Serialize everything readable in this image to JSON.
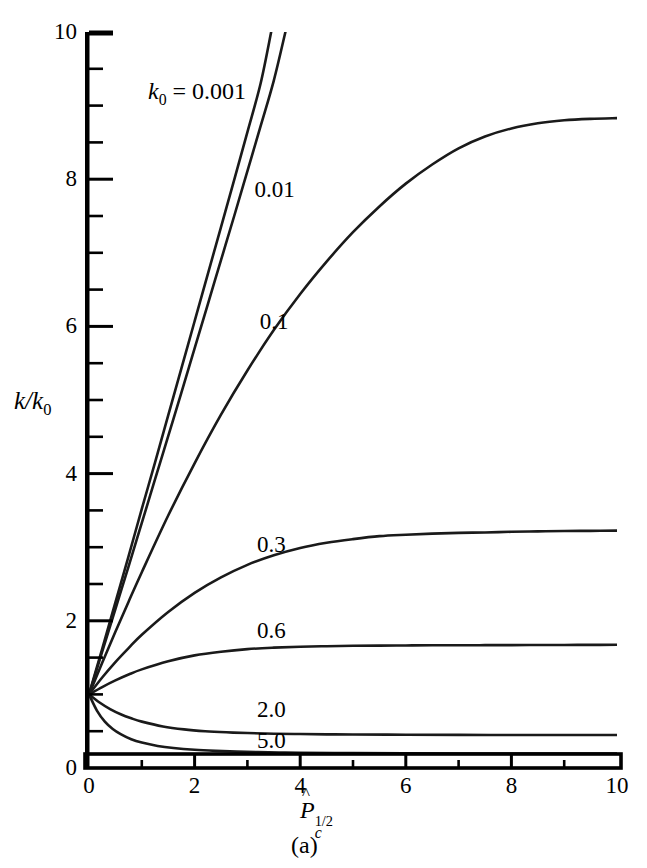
{
  "figure": {
    "caption": "(a)",
    "annotation_k0_prefix": "k",
    "annotation_k0_sub": "0",
    "annotation_k0_eq": " = 0.001",
    "axis_title_y_num": "k",
    "axis_title_y_den": "k",
    "axis_title_y_den_sub": "0",
    "axis_title_y_slash": "/",
    "axis_title_x_main": "P",
    "axis_title_x_sub": "c",
    "axis_title_x_sup": "1/2",
    "line_color": "#1a1a1a",
    "axis_color": "#000000",
    "background": "#ffffff"
  },
  "chart_data": {
    "type": "line",
    "title": "",
    "subtitle": "(a)",
    "xlabel": "P̂c^(1/2)",
    "ylabel": "k/k0",
    "xlim": [
      0,
      10
    ],
    "ylim": [
      0,
      10
    ],
    "grid": false,
    "legend_position": "inline-curve-labels",
    "x_ticks_major": [
      0,
      2,
      4,
      6,
      8,
      10
    ],
    "x_ticks_minor": [
      1,
      3,
      5,
      7,
      9
    ],
    "y_ticks_major": [
      0,
      2,
      4,
      6,
      8,
      10
    ],
    "y_ticks_minor": [
      0.5,
      1,
      1.5,
      2.5,
      3,
      3.5,
      4.5,
      5,
      5.5,
      6.5,
      7,
      7.5,
      8.5,
      9,
      9.5
    ],
    "x_tick_labels": [
      "0",
      "2",
      "4",
      "6",
      "8",
      "10"
    ],
    "y_tick_labels": [
      "0",
      "2",
      "4",
      "6",
      "8",
      "10"
    ],
    "annotation": "k0 = 0.001",
    "series": [
      {
        "name": "0.001",
        "label": "0.001",
        "label_x": 2.55,
        "label_y": 9.1,
        "label_anchor": "annotation",
        "x": [
          0,
          0.25,
          0.5,
          0.75,
          1.0,
          1.25,
          1.5,
          1.75,
          2.0,
          2.25,
          2.5,
          2.75,
          3.0,
          3.25,
          3.45
        ],
        "y": [
          1.0,
          1.62,
          2.25,
          2.88,
          3.52,
          4.15,
          4.79,
          5.43,
          6.07,
          6.71,
          7.35,
          7.99,
          8.64,
          9.3,
          10.0
        ]
      },
      {
        "name": "0.01",
        "label": "0.01",
        "label_x": 3.55,
        "label_y": 7.85,
        "x": [
          0,
          0.25,
          0.5,
          0.75,
          1.0,
          1.25,
          1.5,
          1.75,
          2.0,
          2.25,
          2.5,
          2.75,
          3.0,
          3.25,
          3.5,
          3.72
        ],
        "y": [
          1.0,
          1.58,
          2.16,
          2.74,
          3.33,
          3.92,
          4.51,
          5.1,
          5.7,
          6.3,
          6.9,
          7.5,
          8.11,
          8.72,
          9.34,
          10.0
        ]
      },
      {
        "name": "0.1",
        "label": "0.1",
        "label_x": 3.65,
        "label_y": 6.06,
        "x": [
          0,
          0.25,
          0.5,
          0.75,
          1.0,
          1.5,
          2.0,
          2.5,
          3.0,
          3.5,
          4.0,
          4.5,
          5.0,
          5.5,
          6.0,
          6.5,
          7.0,
          7.5,
          8.0,
          8.5,
          9.0,
          9.5,
          10.0
        ],
        "y": [
          1.0,
          1.43,
          1.85,
          2.26,
          2.66,
          3.43,
          4.14,
          4.8,
          5.4,
          5.95,
          6.44,
          6.88,
          7.28,
          7.63,
          7.94,
          8.2,
          8.42,
          8.58,
          8.69,
          8.76,
          8.8,
          8.82,
          8.83
        ]
      },
      {
        "name": "0.3",
        "label": "0.3",
        "label_x": 3.6,
        "label_y": 3.03,
        "x": [
          0,
          0.25,
          0.5,
          0.75,
          1.0,
          1.5,
          2.0,
          2.5,
          3.0,
          3.5,
          4.0,
          4.5,
          5.0,
          5.5,
          6.0,
          6.5,
          7.0,
          7.5,
          8.0,
          8.5,
          9.0,
          9.5,
          10.0
        ],
        "y": [
          1.0,
          1.23,
          1.44,
          1.63,
          1.81,
          2.12,
          2.38,
          2.59,
          2.76,
          2.89,
          2.99,
          3.06,
          3.11,
          3.15,
          3.17,
          3.185,
          3.195,
          3.2,
          3.21,
          3.215,
          3.22,
          3.222,
          3.225
        ]
      },
      {
        "name": "0.6",
        "label": "0.6",
        "label_x": 3.6,
        "label_y": 1.86,
        "x": [
          0,
          0.25,
          0.5,
          0.75,
          1.0,
          1.5,
          2.0,
          2.5,
          3.0,
          3.5,
          4.0,
          4.5,
          5.0,
          5.5,
          6.0,
          6.5,
          7.0,
          7.5,
          8.0,
          8.5,
          9.0,
          9.5,
          10.0
        ],
        "y": [
          1.0,
          1.1,
          1.19,
          1.27,
          1.34,
          1.45,
          1.53,
          1.58,
          1.615,
          1.635,
          1.648,
          1.655,
          1.66,
          1.663,
          1.665,
          1.667,
          1.668,
          1.669,
          1.67,
          1.671,
          1.672,
          1.673,
          1.674
        ]
      },
      {
        "name": "2.0",
        "label": "2.0",
        "label_x": 3.6,
        "label_y": 0.79,
        "x": [
          0,
          0.2,
          0.4,
          0.6,
          0.8,
          1.0,
          1.4,
          1.8,
          2.2,
          2.6,
          3.0,
          3.5,
          4.0,
          4.5,
          5.0,
          6.0,
          7.0,
          8.0,
          9.0,
          10.0
        ],
        "y": [
          1.0,
          0.89,
          0.8,
          0.73,
          0.675,
          0.63,
          0.565,
          0.525,
          0.5,
          0.485,
          0.475,
          0.466,
          0.461,
          0.457,
          0.455,
          0.452,
          0.45,
          0.449,
          0.448,
          0.448
        ]
      },
      {
        "name": "5.0",
        "label": "5.0",
        "label_x": 3.6,
        "label_y": 0.37,
        "x": [
          0,
          0.15,
          0.3,
          0.45,
          0.6,
          0.8,
          1.0,
          1.3,
          1.6,
          2.0,
          2.4,
          2.8,
          3.2,
          3.6,
          4.0,
          5.0,
          6.0,
          7.0,
          8.0,
          9.0,
          10.0
        ],
        "y": [
          1.0,
          0.78,
          0.63,
          0.53,
          0.46,
          0.39,
          0.345,
          0.3,
          0.272,
          0.248,
          0.233,
          0.223,
          0.216,
          0.211,
          0.208,
          0.202,
          0.199,
          0.197,
          0.196,
          0.195,
          0.195
        ]
      }
    ]
  }
}
